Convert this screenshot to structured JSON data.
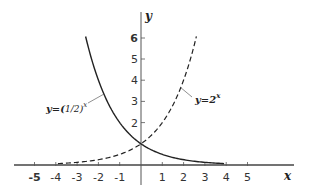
{
  "chart_data": {
    "type": "line",
    "title": "",
    "xlabel": "x",
    "ylabel": "y",
    "xlim": [
      -5.5,
      6.5
    ],
    "ylim": [
      -0.9,
      6.8
    ],
    "grid": false,
    "x_ticks": [
      -5,
      -4,
      -3,
      -2,
      -1,
      1,
      2,
      3,
      4,
      5
    ],
    "x_tick_labels": [
      "-5",
      "-4",
      "-3",
      "-2",
      "-1",
      "1",
      "2",
      "3",
      "4",
      "5"
    ],
    "y_ticks": [
      2,
      3,
      4,
      5,
      6
    ],
    "y_tick_labels": [
      "2",
      "3",
      "4",
      "5",
      "6"
    ],
    "series": [
      {
        "name": "y=(1/2)^x",
        "style": "solid",
        "x": [
          -2.6,
          -2,
          -1.5,
          -1,
          -0.5,
          0,
          0.5,
          1,
          1.5,
          2,
          2.5,
          3,
          3.5,
          3.9
        ],
        "values": [
          6.06,
          4,
          2.83,
          2,
          1.41,
          1,
          0.71,
          0.5,
          0.35,
          0.25,
          0.18,
          0.125,
          0.09,
          0.07
        ]
      },
      {
        "name": "y=2^x",
        "style": "dashed",
        "x": [
          -3.9,
          -3.5,
          -3,
          -2.5,
          -2,
          -1.5,
          -1,
          -0.5,
          0,
          0.5,
          1,
          1.5,
          2,
          2.6
        ],
        "values": [
          0.07,
          0.09,
          0.125,
          0.18,
          0.25,
          0.35,
          0.5,
          0.71,
          1,
          1.41,
          2,
          2.83,
          4,
          6.06
        ]
      }
    ],
    "annotations": [
      {
        "text": "y=(1/2)^x",
        "points_to": "solid curve near x=-1.7"
      },
      {
        "text": "y=2^x",
        "points_to": "dashed curve near x=1.7"
      }
    ]
  },
  "labels": {
    "x_axis": "x",
    "y_axis": "y",
    "curve_a_prefix": "y=(",
    "curve_a_frac": "1/2",
    "curve_a_suffix": ")",
    "curve_a_exp": "x",
    "curve_b_prefix": "y=2",
    "curve_b_exp": "x"
  }
}
